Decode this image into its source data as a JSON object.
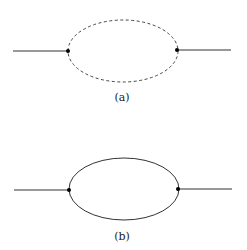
{
  "diagrams": [
    {
      "id": "a",
      "label": "(a)",
      "loop_style": "dashed",
      "left_line": {
        "x1": 13,
        "x2": 68,
        "y": 51
      },
      "right_line": {
        "x1": 177,
        "x2": 231,
        "y": 50
      },
      "loop": {
        "cx": 123,
        "cy": 51,
        "rx": 55,
        "ry": 31
      },
      "vertices": [
        {
          "x": 68,
          "y": 51
        },
        {
          "x": 177,
          "y": 50
        }
      ],
      "label_pos": {
        "x": 102,
        "y": 92
      }
    },
    {
      "id": "b",
      "label": "(b)",
      "loop_style": "solid",
      "left_line": {
        "x1": 14,
        "x2": 69,
        "y": 190
      },
      "right_line": {
        "x1": 178,
        "x2": 232,
        "y": 189
      },
      "loop": {
        "cx": 124,
        "cy": 189,
        "rx": 55,
        "ry": 31
      },
      "vertices": [
        {
          "x": 69,
          "y": 190
        },
        {
          "x": 178,
          "y": 189
        }
      ],
      "label_pos": {
        "x": 102,
        "y": 231
      }
    }
  ],
  "colors": {
    "line": "#333333",
    "vertex": "#000000",
    "background": "#ffffff"
  }
}
